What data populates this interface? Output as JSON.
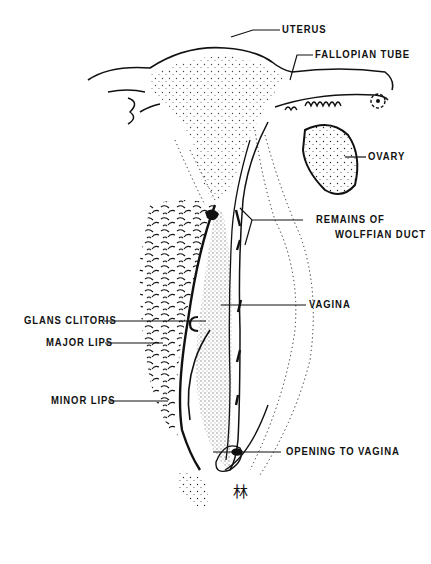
{
  "diagram": {
    "type": "anatomical line drawing",
    "ink_color": "#111111",
    "background": "#ffffff",
    "labels": [
      {
        "id": "uterus",
        "text": "UTERUS"
      },
      {
        "id": "fallopian_tube",
        "text": "FALLOPIAN TUBE"
      },
      {
        "id": "ovary",
        "text": "OVARY"
      },
      {
        "id": "wolffian_1",
        "text": "REMAINS OF"
      },
      {
        "id": "wolffian_2",
        "text": "WOLFFIAN DUCT"
      },
      {
        "id": "vagina",
        "text": "VAGINA"
      },
      {
        "id": "glans_clitoris",
        "text": "GLANS CLITORIS"
      },
      {
        "id": "major_lips",
        "text": "MAJOR LIPS"
      },
      {
        "id": "minor_lips",
        "text": "MINOR LIPS"
      },
      {
        "id": "opening_to_vagina",
        "text": "OPENING TO VAGINA"
      }
    ],
    "signature_glyph": "林"
  }
}
